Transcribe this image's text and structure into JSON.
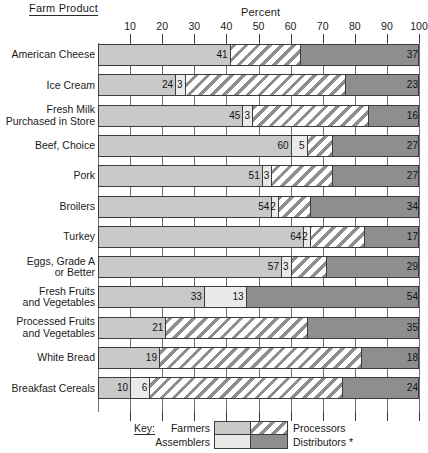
{
  "header": {
    "left_title": "Farm Product",
    "axis_title": "Percent"
  },
  "legend": {
    "key_label": "Key:",
    "farmers": "Farmers",
    "assemblers": "Assemblers",
    "processors": "Processors",
    "distributors": "Distributors *"
  },
  "colors": {
    "farmers": "#c9c9c9",
    "assemblers": "#eaeaea",
    "processors": "#8e8e8e",
    "distributors": "#8e8e8e",
    "axis": "#3a3a3a",
    "grid": "#6e6e6e"
  },
  "chart_data": {
    "type": "bar",
    "title": "",
    "xlabel": "Percent",
    "ylabel": "Farm Product",
    "orientation": "horizontal",
    "stacked": true,
    "xlim": [
      0,
      100
    ],
    "grid": true,
    "legend_position": "bottom",
    "tick_labels": [
      "10",
      "20",
      "30",
      "40",
      "50",
      "60",
      "70",
      "80",
      "90",
      "100"
    ],
    "ticks": [
      10,
      20,
      30,
      40,
      50,
      60,
      70,
      80,
      90,
      100
    ],
    "series": [
      {
        "name": "Farmers",
        "values": [
          41,
          24,
          45,
          60,
          51,
          54,
          64,
          57,
          33,
          21,
          19,
          10
        ]
      },
      {
        "name": "Assemblers",
        "values": [
          0,
          3,
          3,
          5,
          3,
          2,
          2,
          3,
          13,
          0,
          0,
          6
        ]
      },
      {
        "name": "Processors",
        "values": [
          22,
          50,
          36,
          8,
          19,
          10,
          17,
          11,
          0,
          44,
          63,
          60
        ]
      },
      {
        "name": "Distributors",
        "values": [
          37,
          23,
          16,
          27,
          27,
          34,
          17,
          29,
          54,
          35,
          18,
          24
        ]
      }
    ],
    "categories": [
      "American Cheese",
      "Ice Cream",
      "Fresh Milk Purchased in Store",
      "Beef, Choice",
      "Pork",
      "Broilers",
      "Turkey",
      "Eggs, Grade A or Better",
      "Fresh Fruits and Vegetables",
      "Processed Fruits and Vegetables",
      "White Bread",
      "Breakfast Cereals"
    ],
    "rows": [
      {
        "label_lines": [
          "American Cheese"
        ],
        "segments": [
          {
            "group": "farmers",
            "value": 41,
            "label": "41"
          },
          {
            "group": "processors",
            "value": 22,
            "label": ""
          },
          {
            "group": "distributors",
            "value": 37,
            "label": "37"
          }
        ]
      },
      {
        "label_lines": [
          "Ice Cream"
        ],
        "segments": [
          {
            "group": "farmers",
            "value": 24,
            "label": "24"
          },
          {
            "group": "assemblers",
            "value": 3,
            "label": "3"
          },
          {
            "group": "processors",
            "value": 50,
            "label": ""
          },
          {
            "group": "distributors",
            "value": 23,
            "label": "23"
          }
        ]
      },
      {
        "label_lines": [
          "Fresh Milk",
          "Purchased in Store"
        ],
        "segments": [
          {
            "group": "farmers",
            "value": 45,
            "label": "45"
          },
          {
            "group": "assemblers",
            "value": 3,
            "label": "3"
          },
          {
            "group": "processors",
            "value": 36,
            "label": ""
          },
          {
            "group": "distributors",
            "value": 16,
            "label": "16"
          }
        ]
      },
      {
        "label_lines": [
          "Beef, Choice"
        ],
        "segments": [
          {
            "group": "farmers",
            "value": 60,
            "label": "60"
          },
          {
            "group": "assemblers",
            "value": 5,
            "label": "5"
          },
          {
            "group": "processors",
            "value": 8,
            "label": ""
          },
          {
            "group": "distributors",
            "value": 27,
            "label": "27"
          }
        ]
      },
      {
        "label_lines": [
          "Pork"
        ],
        "segments": [
          {
            "group": "farmers",
            "value": 51,
            "label": "51"
          },
          {
            "group": "assemblers",
            "value": 3,
            "label": "3"
          },
          {
            "group": "processors",
            "value": 19,
            "label": ""
          },
          {
            "group": "distributors",
            "value": 27,
            "label": "27"
          }
        ]
      },
      {
        "label_lines": [
          "Broilers"
        ],
        "segments": [
          {
            "group": "farmers",
            "value": 54,
            "label": "54"
          },
          {
            "group": "assemblers",
            "value": 2,
            "label": "2"
          },
          {
            "group": "processors",
            "value": 10,
            "label": ""
          },
          {
            "group": "distributors",
            "value": 34,
            "label": "34"
          }
        ]
      },
      {
        "label_lines": [
          "Turkey"
        ],
        "segments": [
          {
            "group": "farmers",
            "value": 64,
            "label": "64"
          },
          {
            "group": "assemblers",
            "value": 2,
            "label": "2"
          },
          {
            "group": "processors",
            "value": 17,
            "label": ""
          },
          {
            "group": "distributors",
            "value": 17,
            "label": "17"
          }
        ]
      },
      {
        "label_lines": [
          "Eggs, Grade A",
          "or Better"
        ],
        "segments": [
          {
            "group": "farmers",
            "value": 57,
            "label": "57"
          },
          {
            "group": "assemblers",
            "value": 3,
            "label": "3"
          },
          {
            "group": "processors",
            "value": 11,
            "label": ""
          },
          {
            "group": "distributors",
            "value": 29,
            "label": "29"
          }
        ]
      },
      {
        "label_lines": [
          "Fresh Fruits",
          "and Vegetables"
        ],
        "segments": [
          {
            "group": "farmers",
            "value": 33,
            "label": "33"
          },
          {
            "group": "assemblers",
            "value": 13,
            "label": "13"
          },
          {
            "group": "distributors",
            "value": 54,
            "label": "54"
          }
        ]
      },
      {
        "label_lines": [
          "Processed Fruits",
          "and Vegetables"
        ],
        "segments": [
          {
            "group": "farmers",
            "value": 21,
            "label": "21"
          },
          {
            "group": "processors",
            "value": 44,
            "label": ""
          },
          {
            "group": "distributors",
            "value": 35,
            "label": "35"
          }
        ]
      },
      {
        "label_lines": [
          "White Bread"
        ],
        "segments": [
          {
            "group": "farmers",
            "value": 19,
            "label": "19"
          },
          {
            "group": "processors",
            "value": 63,
            "label": ""
          },
          {
            "group": "distributors",
            "value": 18,
            "label": "18"
          }
        ]
      },
      {
        "label_lines": [
          "Breakfast Cereals"
        ],
        "segments": [
          {
            "group": "farmers",
            "value": 10,
            "label": "10"
          },
          {
            "group": "assemblers",
            "value": 6,
            "label": "6"
          },
          {
            "group": "processors",
            "value": 60,
            "label": ""
          },
          {
            "group": "distributors",
            "value": 24,
            "label": "24"
          }
        ]
      }
    ]
  }
}
